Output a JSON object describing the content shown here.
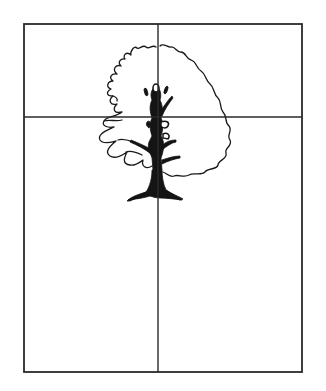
{
  "diagram": {
    "type": "composition-grid",
    "colors": {
      "background": "#ffffff",
      "ink": "#1a1a1a",
      "frame": "#2a2a2a"
    },
    "frame": {
      "x": 24,
      "y": 24,
      "width": 278,
      "height": 348
    },
    "guides": {
      "vertical_x": 158,
      "horizontal_y": 117
    }
  }
}
